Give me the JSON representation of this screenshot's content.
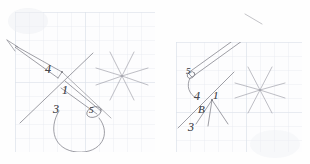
{
  "image": {
    "title": "Two hand-drawn geometric sketches on graph paper",
    "background_color": "#fefefe",
    "width": 310,
    "height": 164
  },
  "paper": {
    "grid_minor_color": "#e9ecf2",
    "grid_major_color": "#dde2ea",
    "grid_cell_px": 14,
    "ink_color": "#6a6a72",
    "label_color": "#4a4a4f"
  },
  "panels": [
    {
      "id": "left-sketch",
      "name": "left-graph-panel",
      "x": 15,
      "y": 12,
      "width": 140,
      "height": 140,
      "labels": [
        {
          "text": "4",
          "x": 30,
          "y": 57,
          "size": 11
        },
        {
          "text": "1",
          "x": 47,
          "y": 78,
          "size": 11
        },
        {
          "text": "3",
          "x": 38,
          "y": 97,
          "size": 11
        },
        {
          "text": "5",
          "x": 73,
          "y": 95,
          "size": 9
        }
      ],
      "figure": {
        "kind": "asterisk-star",
        "center_x": 107,
        "center_y": 64,
        "ray_length": 26,
        "ray_count": 8
      }
    },
    {
      "id": "right-sketch",
      "name": "right-graph-panel",
      "x": 176,
      "y": 42,
      "width": 126,
      "height": 110,
      "labels": [
        {
          "text": "5",
          "x": 11,
          "y": 26,
          "size": 9
        },
        {
          "text": "4",
          "x": 18,
          "y": 54,
          "size": 11
        },
        {
          "text": "1",
          "x": 36,
          "y": 53,
          "size": 10
        },
        {
          "text": "B",
          "x": 22,
          "y": 68,
          "size": 10
        },
        {
          "text": "3",
          "x": 12,
          "y": 85,
          "size": 11
        }
      ],
      "figure": {
        "kind": "asterisk-star",
        "center_x": 84,
        "center_y": 48,
        "ray_length": 25,
        "ray_count": 8
      }
    }
  ],
  "annotations": {
    "left_numbers": [
      "4",
      "1",
      "3",
      "5"
    ],
    "right_numbers": [
      "5",
      "4",
      "1",
      "B",
      "3"
    ],
    "description": "Pencil sketches of crossing line segments with a long tapered needle shape, a curved loop, and an eight-ray asterisk figure, drawn over light blue graph paper."
  }
}
